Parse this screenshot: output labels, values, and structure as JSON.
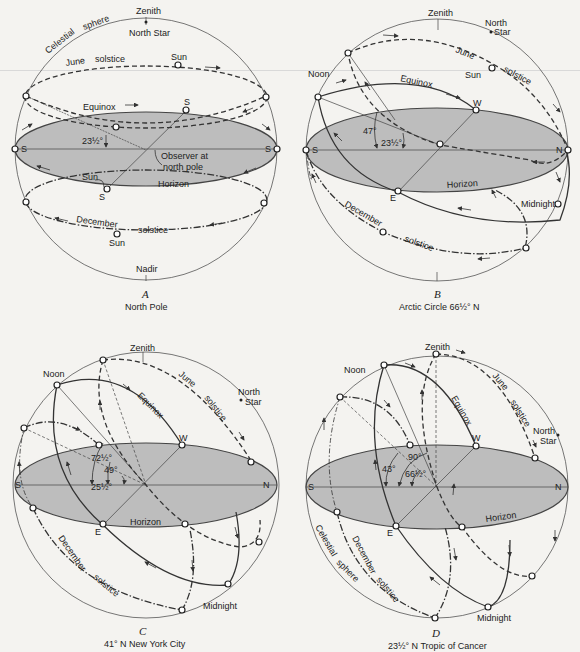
{
  "figure": {
    "background": "#f4f3f0",
    "horizon_fill": "#bdbdbd",
    "panels": [
      {
        "id": "A",
        "letter": "A",
        "caption": "North Pole",
        "labels": {
          "zenith": "Zenith",
          "north_star": "North Star",
          "celestial": "Celestial",
          "sphere": "sphere",
          "june": "June",
          "solstice_june": "solstice",
          "sun_june": "Sun",
          "equinox": "Equinox",
          "s_top": "S",
          "s_left": "S",
          "s_right": "S",
          "s_bottom": "S",
          "angle": "23½°",
          "observer": "Observer at",
          "observer2": "north pole",
          "sun_horizon": "Sun",
          "horizon": "Horizon",
          "december": "December",
          "solstice_dec": "solstice",
          "sun_dec": "Sun",
          "nadir": "Nadir"
        }
      },
      {
        "id": "B",
        "letter": "B",
        "caption": "Arctic Circle 66½° N",
        "labels": {
          "zenith": "Zenith",
          "north": "North",
          "star": "Star",
          "june": "June",
          "solstice_june": "solstice",
          "sun": "Sun",
          "noon": "Noon",
          "equinox": "Equinox",
          "w": "W",
          "angle47": "47°",
          "angle23": "23½°",
          "s": "S",
          "n": "N",
          "e": "E",
          "horizon": "Horizon",
          "midnight": "Midnight",
          "december": "December",
          "solstice_dec": "solstice"
        }
      },
      {
        "id": "C",
        "letter": "C",
        "caption": "41° N  New York City",
        "labels": {
          "zenith": "Zenith",
          "noon": "Noon",
          "june": "June",
          "solstice_june": "solstice",
          "equinox": "Equinox",
          "north": "North",
          "star": "Star",
          "w": "W",
          "angle72": "72½°",
          "angle49": "49°",
          "angle25": "25½°",
          "s": "S",
          "n": "N",
          "e": "E",
          "horizon": "Horizon",
          "december": "December",
          "solstice_dec": "solstice",
          "midnight": "Midnight"
        }
      },
      {
        "id": "D",
        "letter": "D",
        "caption": "23½° N  Tropic of Cancer",
        "labels": {
          "zenith": "Zenith",
          "noon": "Noon",
          "june": "June",
          "solstice_june": "solstice",
          "equinox": "Equinox",
          "north": "North",
          "star": "Star",
          "w": "W",
          "angle90": "90°",
          "angle43": "43°",
          "angle66": "66½°",
          "s": "S",
          "n": "N",
          "e": "E",
          "horizon": "Horizon",
          "celestial": "Celestial",
          "sphere": "sphere",
          "december": "December",
          "solstice_dec": "solstice",
          "midnight": "Midnight"
        }
      }
    ]
  }
}
